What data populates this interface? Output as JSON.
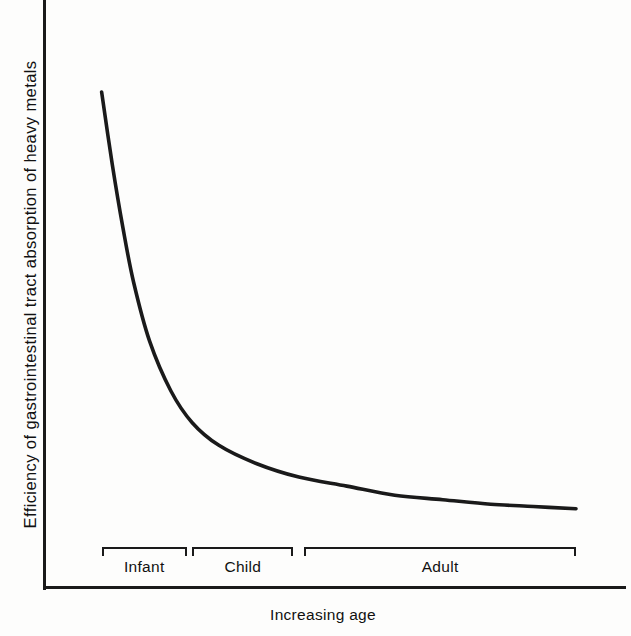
{
  "figure": {
    "background_color": "#fdfdfc",
    "line_color": "#1a1a1a"
  },
  "chart_data": {
    "type": "line",
    "title": "",
    "subtitle": "",
    "xlabel": "Increasing age",
    "ylabel": "Efficiency of gastrointestinal tract absorption of heavy metals",
    "grid": false,
    "legend": "none",
    "axis_ticks": "none",
    "xlim": [
      0,
      100
    ],
    "ylim": [
      0,
      100
    ],
    "annotation": "Schematic decay curve: absorption efficiency is highest in infancy and falls steeply, flattening to a low plateau in adulthood.",
    "series": [
      {
        "name": "Efficiency of gastrointestinal tract absorption of heavy metals",
        "x": [
          11,
          13,
          15,
          17,
          20,
          24,
          28,
          33,
          40,
          48,
          57,
          66,
          75,
          84,
          92,
          100
        ],
        "y": [
          100,
          84,
          70,
          58,
          45,
          34,
          27,
          22,
          18,
          15,
          13,
          11,
          10,
          9,
          8.5,
          8
        ]
      }
    ],
    "x_categories": [
      {
        "label": "Infant",
        "start": 11,
        "end": 27
      },
      {
        "label": "Child",
        "start": 28,
        "end": 47
      },
      {
        "label": "Adult",
        "start": 49,
        "end": 100
      }
    ]
  },
  "axis_titles": {
    "y": "Efficiency of gastrointestinal tract absorption of heavy metals",
    "x": "Increasing age"
  },
  "brackets": [
    {
      "label": "Infant"
    },
    {
      "label": "Child"
    },
    {
      "label": "Adult"
    }
  ]
}
